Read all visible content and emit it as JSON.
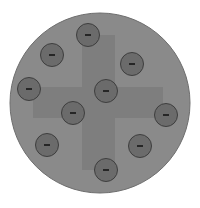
{
  "diagram": {
    "title": "",
    "atom": {
      "cx": 100,
      "cy": 103,
      "r": 90,
      "fill": "#8a8a8a",
      "stroke": "#6e6e6e"
    },
    "cross": {
      "fill": "#7e7e7e",
      "vertical": {
        "x": 82,
        "y": 35,
        "w": 33,
        "h": 135
      },
      "horizontal": {
        "x": 33,
        "y": 87,
        "w": 130,
        "h": 31
      }
    },
    "electron_style": {
      "r": 11.5,
      "fill": "#6b6b6b",
      "stroke": "#3e3e3e",
      "sign_color": "#111111"
    },
    "electrons": [
      {
        "cx": 88,
        "cy": 35,
        "sign": "−"
      },
      {
        "cx": 52,
        "cy": 55,
        "sign": "−"
      },
      {
        "cx": 132,
        "cy": 64,
        "sign": "−"
      },
      {
        "cx": 29,
        "cy": 89,
        "sign": "−"
      },
      {
        "cx": 106,
        "cy": 91,
        "sign": "−"
      },
      {
        "cx": 73,
        "cy": 113,
        "sign": "−"
      },
      {
        "cx": 166,
        "cy": 115,
        "sign": "−"
      },
      {
        "cx": 47,
        "cy": 145,
        "sign": "−"
      },
      {
        "cx": 140,
        "cy": 146,
        "sign": "−"
      },
      {
        "cx": 106,
        "cy": 170,
        "sign": "−"
      }
    ]
  }
}
